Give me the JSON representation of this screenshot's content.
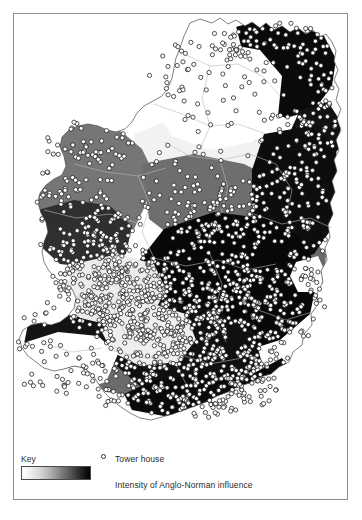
{
  "figure": {
    "type": "thematic-choropleth-map",
    "region": "Ireland",
    "title": "",
    "background_color": "#ffffff",
    "frame_color": "#8e8e8e"
  },
  "legend": {
    "key_label": "Key",
    "tower_symbol_name": "tower-house-circle-icon",
    "tower_label": "Tower house",
    "intensity_label": "Intensity of Anglo-Norman influence",
    "gradient": {
      "from_label": "low",
      "to_label": "high",
      "from_color": "#ffffff",
      "to_color": "#000000"
    }
  },
  "map": {
    "point_symbol": {
      "name": "tower-house-circle-icon",
      "fill": "#ffffff",
      "stroke": "#1a1a1a",
      "radius": 2.1
    },
    "coastline_stroke": "#4a4a4a",
    "county_boundary_stroke": "#b4b4b4",
    "intensity_classes": [
      {
        "label": "none / very low",
        "color": "#ffffff"
      },
      {
        "label": "low",
        "color": "#ededed"
      },
      {
        "label": "moderate",
        "color": "#767676"
      },
      {
        "label": "high",
        "color": "#3a3a3a"
      },
      {
        "label": "very high",
        "color": "#000000"
      }
    ]
  },
  "chart_data": {
    "type": "map",
    "legend_entries": [
      "Tower house",
      "Intensity of Anglo-Norman influence"
    ],
    "shading_scale": {
      "low_color": "#ffffff",
      "high_color": "#000000",
      "description": "continuous white-to-black ramp"
    },
    "regions": [
      {
        "name": "North Donegal",
        "intensity": "none",
        "color": "#ffffff",
        "tower_house_density": "very low"
      },
      {
        "name": "North Antrim / Down coast",
        "intensity": "very high",
        "color": "#000000",
        "tower_house_density": "high"
      },
      {
        "name": "Tyrone / Fermanagh interior",
        "intensity": "none",
        "color": "#ffffff",
        "tower_house_density": "very low"
      },
      {
        "name": "Mayo / Sligo",
        "intensity": "moderate",
        "color": "#767676",
        "tower_house_density": "moderate"
      },
      {
        "name": "Galway / Clare",
        "intensity": "low-moderate",
        "color": "#ededed",
        "tower_house_density": "very high"
      },
      {
        "name": "Midlands (Offaly / Westmeath)",
        "intensity": "high",
        "color": "#3a3a3a",
        "tower_house_density": "high"
      },
      {
        "name": "Leinster east coast (Dublin / Meath / Kildare)",
        "intensity": "very high",
        "color": "#000000",
        "tower_house_density": "very high"
      },
      {
        "name": "Tipperary / Kilkenny",
        "intensity": "very high",
        "color": "#000000",
        "tower_house_density": "very high"
      },
      {
        "name": "Limerick / Cork",
        "intensity": "high",
        "color": "#3a3a3a",
        "tower_house_density": "very high"
      },
      {
        "name": "Kerry peninsulas",
        "intensity": "none",
        "color": "#ffffff",
        "tower_house_density": "low"
      },
      {
        "name": "Wicklow uplands",
        "intensity": "moderate",
        "color": "#767676",
        "tower_house_density": "low"
      }
    ],
    "tower_house_count_plotted": 1100,
    "xlabel": "",
    "ylabel": ""
  }
}
